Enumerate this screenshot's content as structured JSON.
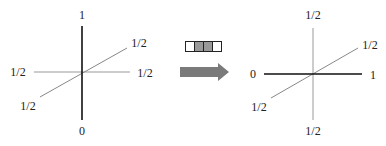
{
  "left_diagram": {
    "vertical_axis": {
      "top_label": "1",
      "bottom_label": "0",
      "color": "#111111"
    },
    "horizontal_axis": {
      "left_label": "1/2",
      "right_label": "1/2",
      "color": "#999999"
    },
    "diagonal_axis": {
      "upper_label": "1/2",
      "lower_label": "1/2",
      "color": "#888888"
    }
  },
  "transition": {
    "cells": [
      {
        "fill": "#ffffff"
      },
      {
        "fill": "#999999"
      },
      {
        "fill": "#999999"
      },
      {
        "fill": "#ffffff"
      }
    ],
    "arrow_color": "#7a7a7a"
  },
  "right_diagram": {
    "horizontal_axis": {
      "left_label": "0",
      "right_label": "1",
      "color": "#111111"
    },
    "vertical_axis": {
      "top_label": "1/2",
      "bottom_label": "1/2",
      "color": "#999999"
    },
    "diagonal_axis": {
      "upper_label": "1/2",
      "lower_label": "1/2",
      "color": "#888888"
    }
  }
}
